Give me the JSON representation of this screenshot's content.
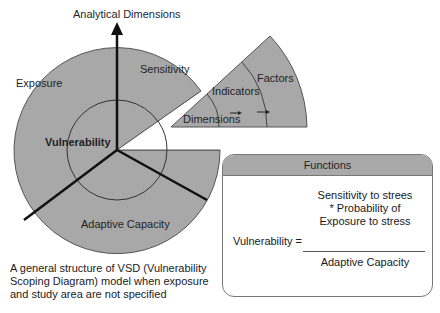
{
  "diagram": {
    "axis_label": "Analytical Dimensions",
    "sectors": {
      "exposure": "Exposure",
      "sensitivity": "Sensitivity",
      "adaptive_capacity": "Adaptive Capacity",
      "center": "Vulnerability"
    },
    "exploded_wedge": {
      "levels": [
        "Dimensions",
        "Indicators",
        "Factors"
      ]
    },
    "colors": {
      "fill": "#a8a8a8",
      "stroke": "#333333",
      "header_fill": "#a9a9a9"
    }
  },
  "functions_box": {
    "title": "Functions",
    "lhs": "Vulnerability =",
    "numerator": [
      "Sensitivity to strees",
      "* Probability of",
      "Exposure to stress"
    ],
    "denominator": "Adaptive Capacity"
  },
  "caption": "A general structure of VSD (Vulnerability Scoping Diagram) model when exposure and study area are not specified"
}
